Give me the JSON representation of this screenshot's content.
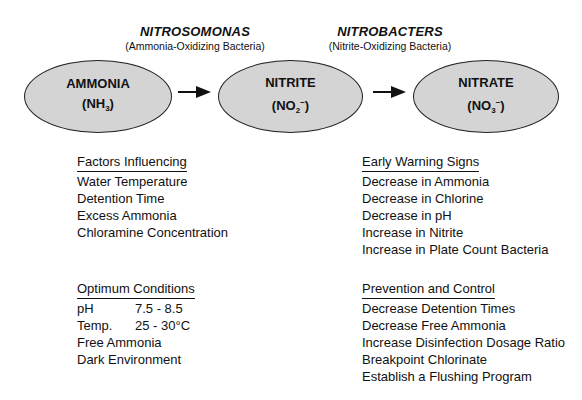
{
  "bacteria": [
    {
      "name": "NITROSOMONAS",
      "description": "(Ammonia-Oxidizing Bacteria)"
    },
    {
      "name": "NITROBACTERS",
      "description": "(Nitrite-Oxidizing Bacteria)"
    }
  ],
  "compounds": [
    {
      "name": "AMMONIA",
      "formula_base": "(NH",
      "formula_sub": "3",
      "formula_sup": "",
      "formula_end": ")"
    },
    {
      "name": "NITRITE",
      "formula_base": "(NO",
      "formula_sub": "2",
      "formula_sup": "−",
      "formula_end": ")"
    },
    {
      "name": "NITRATE",
      "formula_base": "(NO",
      "formula_sub": "3",
      "formula_sup": "−",
      "formula_end": ")"
    }
  ],
  "arrows": [
    "right-arrow",
    "right-arrow"
  ],
  "colors": {
    "ellipse_fill": "#d4d4d4",
    "stroke": "#222222",
    "text": "#111111"
  },
  "factors": {
    "heading": "Factors Influencing",
    "items": [
      "Water Temperature",
      "Detention Time",
      "Excess Ammonia",
      "Chloramine Concentration"
    ]
  },
  "optimum": {
    "heading": "Optimum Conditions",
    "rows": [
      {
        "key": "pH",
        "value": "7.5 - 8.5"
      },
      {
        "key": "Temp.",
        "value": "25 - 30°C"
      }
    ],
    "items": [
      "Free Ammonia",
      "Dark Environment"
    ]
  },
  "warning": {
    "heading": "Early Warning Signs",
    "items": [
      "Decrease in Ammonia",
      "Decrease in Chlorine",
      "Decrease in pH",
      "Increase in Nitrite",
      "Increase in Plate Count Bacteria"
    ]
  },
  "prevention": {
    "heading": "Prevention and Control",
    "items": [
      "Decrease Detention Times",
      "Decrease Free Ammonia",
      "Increase Disinfection Dosage Ratio",
      "Breakpoint Chlorinate",
      "Establish a Flushing Program"
    ]
  }
}
